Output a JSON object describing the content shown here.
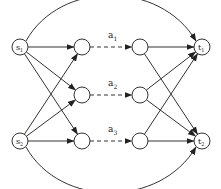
{
  "diagram": {
    "type": "flow-network",
    "sources": [
      {
        "id": "s1",
        "label": "s",
        "sub": "1"
      },
      {
        "id": "s2",
        "label": "s",
        "sub": "2"
      }
    ],
    "sinks": [
      {
        "id": "t1",
        "label": "t",
        "sub": "1"
      },
      {
        "id": "t2",
        "label": "t",
        "sub": "2"
      }
    ],
    "arcs": [
      {
        "id": "a1",
        "label": "a",
        "sub": "1",
        "from": "u1",
        "to": "v1"
      },
      {
        "id": "a2",
        "label": "a",
        "sub": "2",
        "from": "u2",
        "to": "v2"
      },
      {
        "id": "a3",
        "label": "a",
        "sub": "3",
        "from": "u3",
        "to": "v3"
      }
    ],
    "inner_nodes": [
      "u1",
      "u2",
      "u3",
      "v1",
      "v2",
      "v3"
    ],
    "edges": [
      {
        "from": "s1",
        "to": "u1"
      },
      {
        "from": "s1",
        "to": "u2"
      },
      {
        "from": "s1",
        "to": "u3"
      },
      {
        "from": "s2",
        "to": "u1"
      },
      {
        "from": "s2",
        "to": "u2"
      },
      {
        "from": "s2",
        "to": "u3"
      },
      {
        "from": "v1",
        "to": "t1"
      },
      {
        "from": "v1",
        "to": "t2"
      },
      {
        "from": "v2",
        "to": "t1"
      },
      {
        "from": "v2",
        "to": "t2"
      },
      {
        "from": "v3",
        "to": "t1"
      },
      {
        "from": "v3",
        "to": "t2"
      },
      {
        "from": "s1",
        "to": "t1",
        "curved": true
      },
      {
        "from": "s2",
        "to": "t2",
        "curved": true
      }
    ]
  }
}
